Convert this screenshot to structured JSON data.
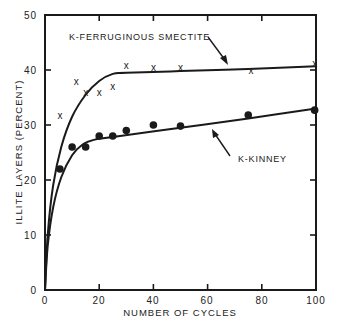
{
  "chart_data": {
    "type": "scatter",
    "title": "",
    "xlabel": "NUMBER OF CYCLES",
    "ylabel": "ILLITE LAYERS (PERCENT)",
    "xlim": [
      0,
      100
    ],
    "ylim": [
      0,
      50
    ],
    "x_ticks": [
      0,
      20,
      40,
      60,
      80,
      100
    ],
    "y_ticks": [
      0,
      10,
      20,
      30,
      40,
      50
    ],
    "grid": false,
    "legend": "none (series labeled directly with arrows)",
    "series": [
      {
        "name": "K-FERRUGINOUS SMECTITE",
        "marker": "x",
        "points": [
          {
            "x": 5.5,
            "y": 31.8
          },
          {
            "x": 11.5,
            "y": 38.0
          },
          {
            "x": 15,
            "y": 36.0
          },
          {
            "x": 20,
            "y": 36.0
          },
          {
            "x": 25,
            "y": 37.0
          },
          {
            "x": 30,
            "y": 40.8
          },
          {
            "x": 40,
            "y": 40.5
          },
          {
            "x": 50,
            "y": 40.5
          },
          {
            "x": 76,
            "y": 40.0
          },
          {
            "x": 99.5,
            "y": 41.2
          }
        ],
        "fit_curve": [
          {
            "x": 0,
            "y": 0
          },
          {
            "x": 1,
            "y": 10
          },
          {
            "x": 3,
            "y": 19
          },
          {
            "x": 6,
            "y": 26
          },
          {
            "x": 10,
            "y": 31.5
          },
          {
            "x": 15,
            "y": 35.5
          },
          {
            "x": 20,
            "y": 38
          },
          {
            "x": 25,
            "y": 39.3
          },
          {
            "x": 30,
            "y": 39.5
          },
          {
            "x": 50,
            "y": 39.8
          },
          {
            "x": 75,
            "y": 40.2
          },
          {
            "x": 100,
            "y": 40.7
          }
        ]
      },
      {
        "name": "K-KINNEY",
        "marker": "filled-circle",
        "points": [
          {
            "x": 5.5,
            "y": 22.0
          },
          {
            "x": 10,
            "y": 26.0
          },
          {
            "x": 15,
            "y": 26.0
          },
          {
            "x": 20,
            "y": 28.0
          },
          {
            "x": 25,
            "y": 28.0
          },
          {
            "x": 30,
            "y": 29.0
          },
          {
            "x": 40,
            "y": 30.0
          },
          {
            "x": 50,
            "y": 29.8
          },
          {
            "x": 75,
            "y": 31.8
          },
          {
            "x": 99.5,
            "y": 32.7
          }
        ],
        "fit_curve": [
          {
            "x": 0,
            "y": 0
          },
          {
            "x": 1,
            "y": 8
          },
          {
            "x": 3,
            "y": 15
          },
          {
            "x": 6,
            "y": 20.5
          },
          {
            "x": 10,
            "y": 24.5
          },
          {
            "x": 14,
            "y": 26.5
          },
          {
            "x": 18,
            "y": 27.3
          },
          {
            "x": 25,
            "y": 27.8
          },
          {
            "x": 50,
            "y": 29.5
          },
          {
            "x": 75,
            "y": 31.2
          },
          {
            "x": 100,
            "y": 33
          }
        ]
      }
    ],
    "annotations": [
      {
        "text": "K-FERRUGINOUS SMECTITE",
        "arrow_to": {
          "x": 75,
          "y": 40.1
        }
      },
      {
        "text": "K-KINNEY",
        "arrow_to": {
          "x": 65,
          "y": 30.7
        }
      }
    ]
  },
  "labels": {
    "xlabel": "NUMBER OF CYCLES",
    "ylabel": "ILLITE LAYERS (PERCENT)",
    "smectite": "K-FERRUGINOUS SMECTITE",
    "kinney": "K-KINNEY"
  },
  "ticks": {
    "x": [
      "0",
      "20",
      "40",
      "60",
      "80",
      "100"
    ],
    "y": [
      "0",
      "10",
      "20",
      "30",
      "40",
      "50"
    ]
  },
  "markers": {
    "x_glyph": "x"
  },
  "colors": {
    "ink": "#1a1a1a",
    "background": "#ffffff"
  }
}
